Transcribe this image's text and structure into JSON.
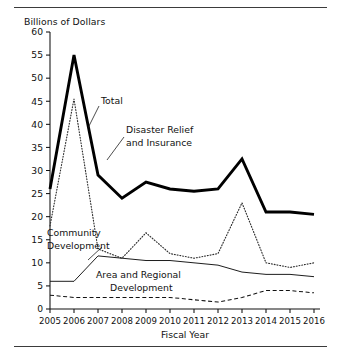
{
  "figure": {
    "clipped_caption_text": "",
    "y_axis_note": "Billions of Dollars",
    "x_axis_title": "Fiscal Year"
  },
  "annotations": {
    "total": "Total",
    "disaster_line1": "Disaster Relief",
    "disaster_line2": "and Insurance",
    "community_line1": "Community",
    "community_line2": "Development",
    "area_line1": "Area and Regional",
    "area_line2": "Development"
  },
  "colors": {
    "total": "#000000",
    "disaster": "#2f2f2f",
    "community": "#111111",
    "area": "#111111",
    "axis": "#111111",
    "rule": "#3b3b3b",
    "background": "#ffffff"
  },
  "chart_data": {
    "type": "line",
    "title": "",
    "xlabel": "Fiscal Year",
    "ylabel": "Billions of Dollars",
    "x": [
      2005,
      2006,
      2007,
      2008,
      2009,
      2010,
      2011,
      2012,
      2013,
      2014,
      2015,
      2016
    ],
    "xtick_labels": [
      "2005",
      "2006",
      "2007",
      "2008",
      "2009",
      "2010",
      "2011",
      "2012",
      "2013",
      "2014",
      "2015",
      "2016"
    ],
    "ytick_labels": [
      "0",
      "5",
      "10",
      "15",
      "20",
      "25",
      "30",
      "35",
      "40",
      "45",
      "50",
      "55",
      "60"
    ],
    "yticks": [
      0,
      5,
      10,
      15,
      20,
      25,
      30,
      35,
      40,
      45,
      50,
      55,
      60
    ],
    "ylim": [
      0,
      60
    ],
    "xlim": [
      2005,
      2016
    ],
    "grid": false,
    "legend_position": "inline-annotations",
    "series": [
      {
        "name": "Total",
        "style": "thick-solid",
        "values": [
          26,
          55,
          29,
          24,
          27.5,
          26,
          25.5,
          26,
          32.5,
          21,
          21,
          20.5
        ]
      },
      {
        "name": "Disaster Relief and Insurance",
        "style": "dotted",
        "values": [
          18,
          45.5,
          13,
          11,
          16.5,
          12,
          11,
          12,
          23,
          10,
          9,
          10
        ]
      },
      {
        "name": "Community Development",
        "style": "thin-solid",
        "values": [
          6,
          6,
          11.5,
          11,
          10.5,
          10.5,
          10,
          9.5,
          8,
          7.5,
          7.5,
          7
        ]
      },
      {
        "name": "Area and Regional Development",
        "style": "dashed",
        "values": [
          3,
          2.5,
          2.5,
          2.5,
          2.5,
          2.5,
          2,
          1.5,
          2.5,
          4,
          4,
          3.5
        ]
      }
    ]
  }
}
